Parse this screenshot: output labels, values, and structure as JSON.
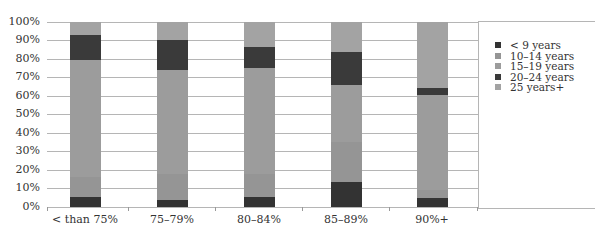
{
  "chart_data": {
    "type": "bar",
    "stacked": true,
    "percent_stacked": true,
    "title": "",
    "xlabel": "",
    "ylabel": "",
    "ylim": [
      0,
      100
    ],
    "yticks": [
      "0%",
      "10%",
      "20%",
      "30%",
      "40%",
      "50%",
      "60%",
      "70%",
      "80%",
      "90%",
      "100%"
    ],
    "grid": true,
    "legend_position": "right",
    "categories": [
      "< than 75%",
      "75–79%",
      "80–84%",
      "85–89%",
      "90%+"
    ],
    "series": [
      {
        "name": "< 9 years",
        "color": "#333333",
        "values": [
          5.5,
          4,
          5.5,
          13.5,
          5
        ]
      },
      {
        "name": "10–14 years",
        "color": "#959595",
        "values": [
          10.5,
          14,
          12.5,
          21.5,
          4
        ]
      },
      {
        "name": "15–19 years",
        "color": "#9c9c9c",
        "values": [
          63,
          56,
          57,
          31,
          51.5
        ]
      },
      {
        "name": "20–24 years",
        "color": "#3a3a3a",
        "values": [
          14,
          16,
          11,
          17.5,
          3.5
        ]
      },
      {
        "name": "25 years+",
        "color": "#a3a3a3",
        "values": [
          7,
          10,
          14,
          16.5,
          36
        ]
      }
    ]
  }
}
